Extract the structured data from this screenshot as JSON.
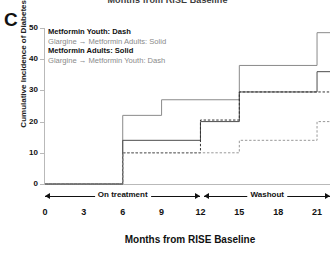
{
  "figure": {
    "panel_label": "C",
    "cut_off_title_above": "Months from RISE Baseline",
    "xlabel": "Months from RISE Baseline",
    "ylabel": "Cumulative Incidence of Diabetes (%)"
  },
  "legend": {
    "rows": [
      {
        "text": "Metformin Youth: Dash",
        "style": "bold"
      },
      {
        "text": "Glargine → Metformin Adults: Solid",
        "style": "grey"
      },
      {
        "text": "Metformin Adults: Solid",
        "style": "bold"
      },
      {
        "text": "Glargine → Metformin Youth: Dash",
        "style": "grey"
      }
    ]
  },
  "annotations": {
    "on_treatment": "On treatment",
    "washout": "Washout"
  },
  "chart_data": {
    "type": "line",
    "subtype": "kaplan-meier-step",
    "title": "",
    "xlabel": "Months from RISE Baseline",
    "ylabel": "Cumulative Incidence of Diabetes (%)",
    "xlim": [
      0,
      22
    ],
    "ylim": [
      0,
      50
    ],
    "xticks": [
      0,
      3,
      6,
      9,
      12,
      15,
      18,
      21
    ],
    "yticks": [
      0,
      10,
      20,
      30,
      40,
      50
    ],
    "grid": false,
    "legend_position": "upper-left-inside",
    "colors": {
      "metformin_adults": "#4d4d4d",
      "glargine_metformin_adults": "#8a8a8a",
      "metformin_youth": "#333333",
      "glargine_metformin_youth": "#999999"
    },
    "series": [
      {
        "name": "Glargine → Metformin Adults",
        "dash": "solid",
        "color": "#8a8a8a",
        "x": [
          0,
          6,
          9,
          15,
          21,
          22
        ],
        "y": [
          0,
          22,
          27,
          38,
          48.5,
          48.5
        ]
      },
      {
        "name": "Metformin Adults",
        "dash": "solid",
        "color": "#4d4d4d",
        "x": [
          0,
          6,
          12,
          15,
          21,
          22
        ],
        "y": [
          0,
          14,
          20,
          29.5,
          36,
          36
        ]
      },
      {
        "name": "Metformin Youth",
        "dash": "dash",
        "color": "#333333",
        "x": [
          0,
          6,
          12,
          15,
          22
        ],
        "y": [
          0,
          10,
          20.5,
          29.5,
          29.5
        ]
      },
      {
        "name": "Glargine → Metformin Youth",
        "dash": "dash",
        "color": "#999999",
        "x": [
          0,
          6,
          15,
          21,
          22
        ],
        "y": [
          0,
          10,
          14,
          20,
          20
        ]
      }
    ]
  }
}
